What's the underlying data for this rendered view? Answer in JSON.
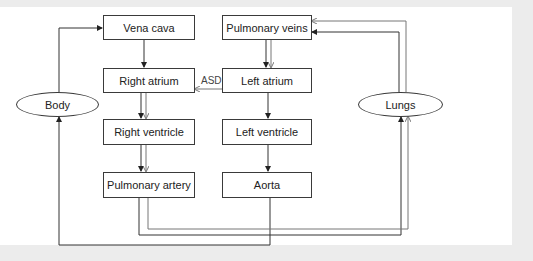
{
  "diagram": {
    "title": "",
    "nodes": {
      "vena_cava": "Vena cava",
      "pulmonary_veins": "Pulmonary veins",
      "right_atrium": "Right atrium",
      "left_atrium": "Left atrium",
      "right_ventricle": "Right ventricle",
      "left_ventricle": "Left ventricle",
      "pulmonary_artery": "Pulmonary artery",
      "aorta": "Aorta",
      "body": "Body",
      "lungs": "Lungs"
    },
    "edge_labels": {
      "asd": "ASD"
    },
    "edges": [
      {
        "from": "Body",
        "to": "Vena cava"
      },
      {
        "from": "Vena cava",
        "to": "Right atrium"
      },
      {
        "from": "Left atrium",
        "to": "Right atrium",
        "label": "ASD"
      },
      {
        "from": "Right atrium",
        "to": "Right ventricle",
        "double": true
      },
      {
        "from": "Right ventricle",
        "to": "Pulmonary artery",
        "double": true
      },
      {
        "from": "Pulmonary artery",
        "to": "Lungs",
        "double": true
      },
      {
        "from": "Lungs",
        "to": "Pulmonary veins",
        "double": true
      },
      {
        "from": "Pulmonary veins",
        "to": "Left atrium",
        "double": true
      },
      {
        "from": "Left atrium",
        "to": "Left ventricle"
      },
      {
        "from": "Left ventricle",
        "to": "Aorta"
      },
      {
        "from": "Aorta",
        "to": "Body"
      }
    ],
    "colors": {
      "line_dark": "#222222",
      "line_gray": "#777777",
      "background": "#ffffff",
      "frame": "#ececec"
    }
  }
}
